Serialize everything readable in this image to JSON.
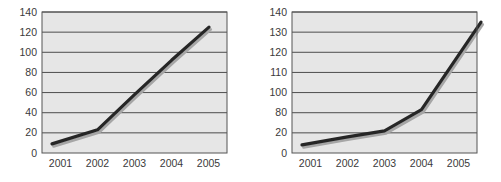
{
  "page": {
    "background_color": "#ffffff",
    "width": 501,
    "height": 182
  },
  "style": {
    "plot_background_color": "#e6e6e6",
    "plot_border_color": "#555555",
    "gridline_color": "#4d4d4d",
    "series_line_color": "#262626",
    "series_shadow_color": "#a6a6a6",
    "tick_label_color": "#3a3a3a"
  },
  "charts": [
    {
      "id": "chart-left",
      "name": "left-line-chart",
      "chart_data": {
        "type": "line",
        "title": "",
        "subtitle": "",
        "xlabel": "",
        "ylabel": "",
        "categories": [
          "2001",
          "2002",
          "2003",
          "2004",
          "2005"
        ],
        "x": [
          "2001",
          "2002",
          "2003",
          "2004",
          "2005"
        ],
        "series": [
          {
            "name": "series-1",
            "values": [
              9,
              23,
              58,
              92,
              125
            ]
          }
        ],
        "values": [
          9,
          23,
          58,
          92,
          125
        ],
        "y_ticks": [
          0,
          20,
          40,
          60,
          80,
          100,
          120,
          140
        ],
        "y_tick_labels": [
          "0",
          "20",
          "40",
          "60",
          "80",
          "100",
          "120",
          "140"
        ],
        "x_tick_labels": [
          "2001",
          "2002",
          "2003",
          "2004",
          "2005"
        ],
        "ylim": [
          0,
          140
        ],
        "y_axis_scale": "linear",
        "grid": true,
        "grid_orientation": "horizontal",
        "legend": false,
        "legend_position": "none",
        "markers": false,
        "annotations": []
      }
    },
    {
      "id": "chart-right",
      "name": "right-line-chart",
      "chart_data": {
        "type": "line",
        "title": "",
        "subtitle": "",
        "xlabel": "",
        "ylabel": "",
        "categories": [
          "2001",
          "2002",
          "2003",
          "2004",
          "2005"
        ],
        "x": [
          "2001",
          "2002",
          "2003",
          "2004",
          "2005"
        ],
        "series": [
          {
            "name": "series-1",
            "values": [
              8,
              16,
              26,
              83,
              135
            ]
          }
        ],
        "values": [
          8,
          16,
          26,
          83,
          135
        ],
        "y_ticks": [
          0,
          20,
          80,
          100,
          110,
          120,
          130,
          140
        ],
        "y_tick_labels": [
          "0",
          "20",
          "80",
          "100",
          "110",
          "120",
          "130",
          "140"
        ],
        "x_tick_labels": [
          "2001",
          "2002",
          "2003",
          "2004",
          "2005"
        ],
        "ylim": [
          0,
          140
        ],
        "y_axis_scale": "non-uniform",
        "grid": true,
        "grid_orientation": "horizontal",
        "legend": false,
        "legend_position": "none",
        "markers": false,
        "annotations": []
      }
    }
  ]
}
